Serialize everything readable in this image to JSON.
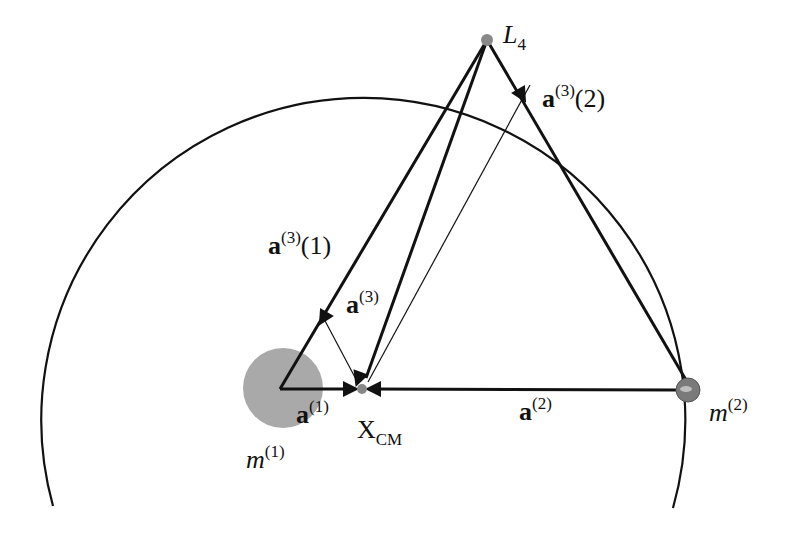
{
  "diagram": {
    "colors": {
      "line": "#111111",
      "m1_fill": "#a9a9a9",
      "m2_fill": "#7a7a7a",
      "point_fill": "#888888",
      "background": "#ffffff"
    },
    "points": {
      "L4": {
        "x": 487,
        "y": 40
      },
      "XCM": {
        "x": 362,
        "y": 389
      },
      "m1": {
        "x": 280,
        "y": 389
      },
      "m2": {
        "x": 688,
        "y": 390
      },
      "a3_2_foot": {
        "x": 530,
        "y": 85
      },
      "a3_1_foot": {
        "x": 323,
        "y": 317
      }
    },
    "orbit_circle": {
      "cx": 362,
      "cy": 390,
      "r": 322
    },
    "labels": {
      "L4": {
        "main": "L",
        "sub": "4"
      },
      "a3_2": {
        "vec": "a",
        "sup": "(3)",
        "arg": "(2)"
      },
      "a3_1": {
        "vec": "a",
        "sup": "(3)",
        "arg": "(1)"
      },
      "a3": {
        "vec": "a",
        "sup": "(3)"
      },
      "a1": {
        "vec": "a",
        "sup": "(1)"
      },
      "a2": {
        "vec": "a",
        "sup": "(2)"
      },
      "xcm": {
        "main": "X",
        "sub": "CM"
      },
      "m1": {
        "main": "m",
        "sup": "(1)"
      },
      "m2": {
        "main": "m",
        "sup": "(2)"
      }
    }
  }
}
